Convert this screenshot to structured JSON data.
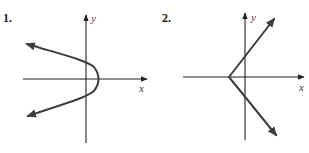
{
  "graphs": [
    {
      "number_label": "1.",
      "x_axis_label": "x",
      "y_axis_label": "y",
      "curve": "parabola opening left with arrows on both ends",
      "vertex": [
        100,
        79
      ],
      "y_intercepts_px": [
        63,
        95
      ]
    },
    {
      "number_label": "2.",
      "x_axis_label": "x",
      "y_axis_label": "y",
      "curve": "sideways V (absolute value opening right) with arrows on both arms",
      "vertex": [
        229,
        77
      ]
    }
  ],
  "colors": {
    "background": "#ffffff",
    "axis": "#231f20",
    "curve": "#3d3d3d"
  }
}
